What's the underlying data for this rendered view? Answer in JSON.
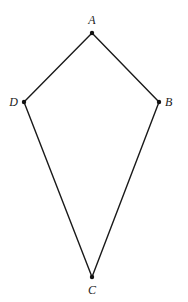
{
  "diagram": {
    "type": "kite",
    "style": {
      "line_color": "#1a1a1a",
      "point_color": "#111111",
      "label_color": "#222222",
      "background": "#ffffff"
    },
    "vertices": [
      {
        "id": "A",
        "label": "A",
        "x": 92,
        "y": 33,
        "label_x": 92,
        "label_y": 24,
        "anchor": "middle"
      },
      {
        "id": "B",
        "label": "B",
        "x": 159,
        "y": 102,
        "label_x": 165,
        "label_y": 106,
        "anchor": "start"
      },
      {
        "id": "C",
        "label": "C",
        "x": 92,
        "y": 277,
        "label_x": 92,
        "label_y": 294,
        "anchor": "middle"
      },
      {
        "id": "D",
        "label": "D",
        "x": 24,
        "y": 102,
        "label_x": 18,
        "label_y": 106,
        "anchor": "end"
      }
    ],
    "edges": [
      {
        "id": "AB",
        "from": "A",
        "to": "B"
      },
      {
        "id": "BC",
        "from": "B",
        "to": "C"
      },
      {
        "id": "CD",
        "from": "C",
        "to": "D"
      },
      {
        "id": "DA",
        "from": "D",
        "to": "A"
      }
    ]
  }
}
